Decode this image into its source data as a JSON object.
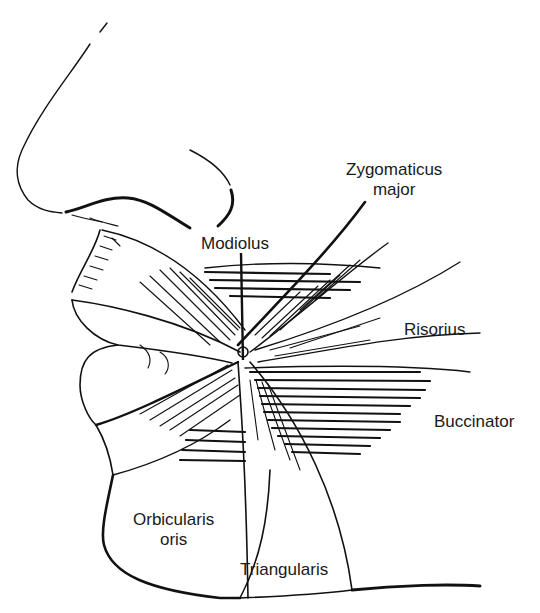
{
  "figure": {
    "labels": [
      {
        "id": "zygomaticus-major",
        "lines": [
          "Zygomaticus",
          "major"
        ],
        "x": 346,
        "y": 160
      },
      {
        "id": "modiolus",
        "lines": [
          "Modiolus"
        ],
        "x": 201,
        "y": 234
      },
      {
        "id": "risorius",
        "lines": [
          "Risorius"
        ],
        "x": 404,
        "y": 320
      },
      {
        "id": "buccinator",
        "lines": [
          "Buccinator"
        ],
        "x": 434,
        "y": 412
      },
      {
        "id": "orbicularis-oris",
        "lines": [
          "Orbicularis",
          "oris"
        ],
        "x": 133,
        "y": 510
      },
      {
        "id": "triangularis",
        "lines": [
          "Triangularis"
        ],
        "x": 240,
        "y": 560
      }
    ],
    "colors": {
      "ink": "#111111",
      "text": "#1a1a1a",
      "background": "#ffffff"
    }
  }
}
